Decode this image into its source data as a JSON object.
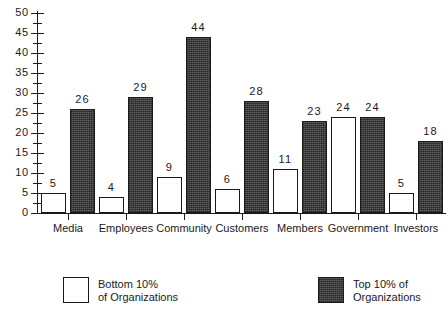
{
  "chart_data": {
    "type": "bar",
    "title": "",
    "subtitle": "",
    "xlabel": "",
    "ylabel": "",
    "ylim": [
      0,
      50
    ],
    "ytick_step": 5,
    "yticks": [
      "0",
      "5",
      "10",
      "15",
      "20",
      "25",
      "30",
      "35",
      "40",
      "45",
      "50"
    ],
    "minor_ticks": true,
    "grid": false,
    "legend_position": "bottom",
    "categories": [
      "Media",
      "Employees",
      "Community",
      "Customers",
      "Members",
      "Government",
      "Investors"
    ],
    "series": [
      {
        "name": "Bottom 10% of Organizations",
        "fill": "white",
        "color": "#ffffff",
        "values": [
          5,
          4,
          9,
          6,
          11,
          24,
          5
        ]
      },
      {
        "name": "Top 10% of Organizations",
        "fill": "hatched-dark",
        "color": "#4a4a4a",
        "values": [
          26,
          29,
          44,
          28,
          23,
          24,
          18
        ]
      }
    ]
  },
  "legend": {
    "items": [
      {
        "label_line1": "Bottom  10%",
        "label_line2": "of  Organizations",
        "swatch": "light"
      },
      {
        "label_line1": "Top 10% of",
        "label_line2": "Organizations",
        "swatch": "dark"
      }
    ]
  }
}
